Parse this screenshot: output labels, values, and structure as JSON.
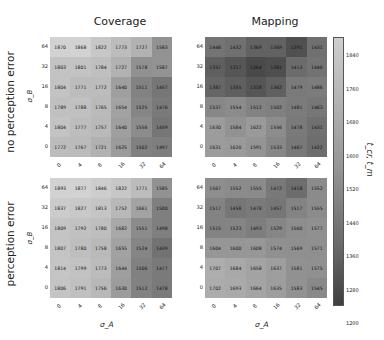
{
  "chart_data": {
    "type": "heatmap",
    "col_titles": [
      "Coverage",
      "Mapping"
    ],
    "row_titles": [
      "no perception error",
      "perception error"
    ],
    "xlabel": "σ_A",
    "ylabel": "σ_B",
    "x_ticks": [
      "0",
      "4",
      "8",
      "16",
      "32",
      "64"
    ],
    "y_ticks_top_to_bottom": [
      "64",
      "32",
      "16",
      "8",
      "4",
      "0"
    ],
    "colorbar": {
      "label": "t_cr, t_m",
      "ticks": [
        "1840",
        "1760",
        "1680",
        "1600",
        "1520",
        "1440",
        "1360",
        "1280",
        "1200"
      ],
      "range": [
        1200,
        1870
      ]
    },
    "panels": [
      {
        "id": "coverage-no-error",
        "title": "Coverage",
        "row": "no perception error",
        "values": [
          [
            1870,
            1868,
            1822,
            1773,
            1727,
            1583
          ],
          [
            1803,
            1801,
            1784,
            1727,
            1578,
            1587
          ],
          [
            1804,
            1771,
            1772,
            1640,
            1511,
            1457
          ],
          [
            1789,
            1788,
            1765,
            1654,
            1525,
            1476
          ],
          [
            1804,
            1777,
            1757,
            1640,
            1556,
            1459
          ],
          [
            1772,
            1767,
            1721,
            1625,
            1502,
            1497
          ]
        ]
      },
      {
        "id": "mapping-no-error",
        "title": "Mapping",
        "row": "no perception error",
        "values": [
          [
            1448,
            1432,
            1369,
            1369,
            1291,
            1431
          ],
          [
            1357,
            1317,
            1264,
            1281,
            1413,
            1446
          ],
          [
            1387,
            1355,
            1318,
            1362,
            1479,
            1486
          ],
          [
            1537,
            1554,
            1512,
            1502,
            1481,
            1463
          ],
          [
            1630,
            1584,
            1622,
            1556,
            1478,
            1431
          ],
          [
            1631,
            1620,
            1591,
            1533,
            1467,
            1422
          ]
        ]
      },
      {
        "id": "coverage-error",
        "title": "Coverage",
        "row": "perception error",
        "values": [
          [
            1893,
            1877,
            1846,
            1822,
            1771,
            1585
          ],
          [
            1837,
            1827,
            1813,
            1752,
            1661,
            1500
          ],
          [
            1809,
            1792,
            1780,
            1682,
            1551,
            1498
          ],
          [
            1807,
            1780,
            1758,
            1655,
            1524,
            1439
          ],
          [
            1814,
            1799,
            1773,
            1644,
            1506,
            1477
          ],
          [
            1806,
            1791,
            1756,
            1630,
            1512,
            1478
          ]
        ]
      },
      {
        "id": "mapping-error",
        "title": "Mapping",
        "row": "perception error",
        "values": [
          [
            1567,
            1552,
            1555,
            1472,
            1418,
            1552
          ],
          [
            1517,
            1458,
            1478,
            1457,
            1517,
            1555
          ],
          [
            1515,
            1523,
            1493,
            1529,
            1560,
            1577
          ],
          [
            1604,
            1600,
            1608,
            1574,
            1569,
            1571
          ],
          [
            1707,
            1684,
            1658,
            1637,
            1581,
            1575
          ],
          [
            1702,
            1693,
            1664,
            1635,
            1583,
            1545
          ]
        ]
      }
    ]
  }
}
